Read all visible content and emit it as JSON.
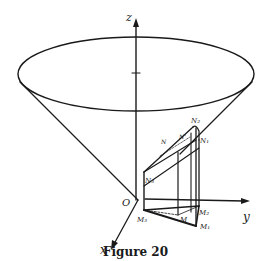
{
  "figure": {
    "caption": "Figure 20",
    "axes": {
      "z": "z",
      "y": "y",
      "x": "x",
      "origin": "O"
    },
    "points": {
      "N": "N",
      "N_prime": "N'",
      "N1": "N₁",
      "N2": "N₂",
      "N3": "N₃",
      "M": "M",
      "M1": "M₁",
      "M2": "M₂",
      "M3": "M₃"
    }
  }
}
